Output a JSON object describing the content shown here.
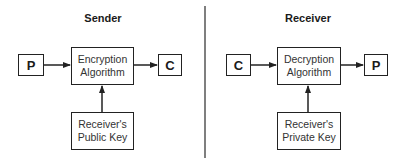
{
  "sender": {
    "title": "Sender",
    "input": "P",
    "algorithm_line1": "Encryption",
    "algorithm_line2": "Algorithm",
    "output": "C",
    "key_line1": "Receiver's",
    "key_line2": "Public Key"
  },
  "receiver": {
    "title": "Receiver",
    "input": "C",
    "algorithm_line1": "Decryption",
    "algorithm_line2": "Algorithm",
    "output": "P",
    "key_line1": "Receiver's",
    "key_line2": "Private Key"
  },
  "colors": {
    "line": "#222222",
    "divider": "#555555",
    "background": "#ffffff"
  }
}
